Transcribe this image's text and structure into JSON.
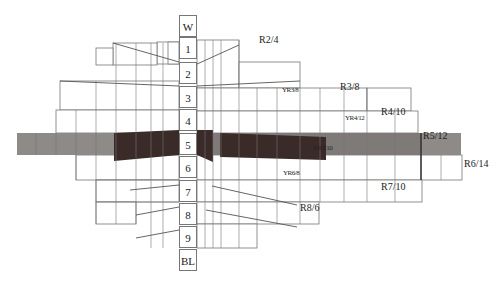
{
  "diagram": {
    "type": "munsell-color-solid-slice",
    "value_scale": [
      "W",
      "1",
      "2",
      "3",
      "4",
      "5",
      "6",
      "7",
      "8",
      "9",
      "BL"
    ],
    "chroma_labels": [
      {
        "text": "R2/4",
        "x": 259,
        "y": 41,
        "small": false
      },
      {
        "text": "YR3/8",
        "x": 282,
        "y": 90,
        "small": true
      },
      {
        "text": "R3/8",
        "x": 340,
        "y": 88,
        "small": false
      },
      {
        "text": "YR4/12",
        "x": 345,
        "y": 118,
        "small": true
      },
      {
        "text": "R4/10",
        "x": 381,
        "y": 113,
        "small": false
      },
      {
        "text": "YR5/10",
        "x": 313,
        "y": 148,
        "small": true
      },
      {
        "text": "R5/12",
        "x": 423,
        "y": 137,
        "small": false
      },
      {
        "text": "R6/14",
        "x": 464,
        "y": 165,
        "small": false
      },
      {
        "text": "YR6/8",
        "x": 283,
        "y": 172,
        "small": true
      },
      {
        "text": "R7/10",
        "x": 381,
        "y": 186,
        "small": false
      },
      {
        "text": "R8/6",
        "x": 300,
        "y": 208,
        "small": false
      }
    ],
    "colors": {
      "line": "#777777",
      "dark_band": "#3a2a28",
      "mid_band": "#7a7472",
      "light_band": "#8e8a88"
    }
  }
}
